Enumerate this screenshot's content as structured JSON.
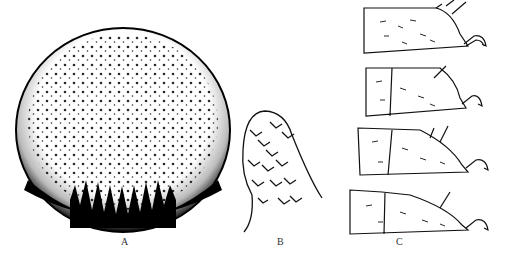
{
  "figure": {
    "panels": [
      {
        "id": "A",
        "label": "A",
        "description": "circular dorsal plate with dense punctation, darker margin"
      },
      {
        "id": "B",
        "label": "B",
        "description": "lobed appendage with scale-like markings"
      },
      {
        "id": "C",
        "label": "C",
        "description": "four leg segments (tarsi) with setae and claws"
      }
    ],
    "colors": {
      "ink": "#111111",
      "background": "#ffffff"
    }
  }
}
